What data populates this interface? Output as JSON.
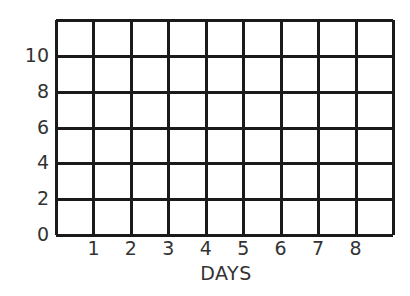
{
  "chart_data": {
    "type": "table",
    "title": "",
    "xlabel": "DAYS",
    "ylabel": "",
    "x_ticks": [
      "1",
      "2",
      "3",
      "4",
      "5",
      "6",
      "7",
      "8"
    ],
    "y_ticks": [
      "0",
      "2",
      "4",
      "6",
      "8",
      "10"
    ],
    "xlim": [
      0,
      9
    ],
    "ylim": [
      0,
      12
    ],
    "grid": true,
    "legend": null,
    "series": [],
    "note": "Empty graph grid with no plotted data"
  },
  "labels": {
    "x_title": "DAYS",
    "y_ticks": [
      {
        "text": "10",
        "value": 10
      },
      {
        "text": "8",
        "value": 8
      },
      {
        "text": "6",
        "value": 6
      },
      {
        "text": "4",
        "value": 4
      },
      {
        "text": "2",
        "value": 2
      },
      {
        "text": "0",
        "value": 0
      }
    ],
    "x_ticks": [
      {
        "text": "1",
        "value": 1
      },
      {
        "text": "2",
        "value": 2
      },
      {
        "text": "3",
        "value": 3
      },
      {
        "text": "4",
        "value": 4
      },
      {
        "text": "5",
        "value": 5
      },
      {
        "text": "6",
        "value": 6
      },
      {
        "text": "7",
        "value": 7
      },
      {
        "text": "8",
        "value": 8
      }
    ]
  },
  "colors": {
    "grid_line": "#1a1a1a",
    "text": "#333333",
    "background": "#ffffff"
  }
}
